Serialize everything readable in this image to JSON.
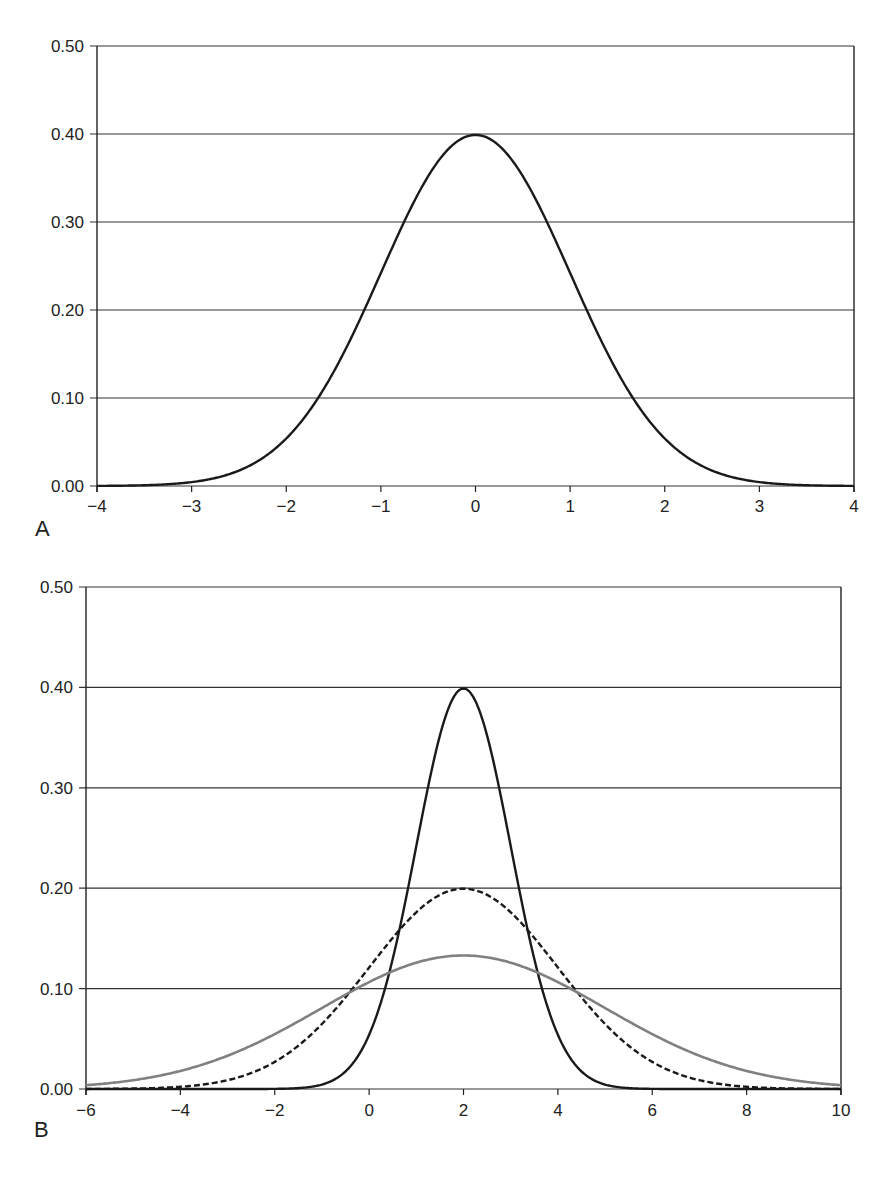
{
  "chart_data": [
    {
      "panel_label": "A",
      "type": "line",
      "title": "",
      "xlabel": "",
      "ylabel": "",
      "xlim": [
        -4,
        4
      ],
      "ylim": [
        0,
        0.5
      ],
      "x_ticks": [
        "−4",
        "−3",
        "−2",
        "−1",
        "0",
        "1",
        "2",
        "3",
        "4"
      ],
      "x_tick_values": [
        -4,
        -3,
        -2,
        -1,
        0,
        1,
        2,
        3,
        4
      ],
      "y_ticks": [
        "0.00",
        "0.10",
        "0.20",
        "0.30",
        "0.40",
        "0.50"
      ],
      "y_tick_values": [
        0,
        0.1,
        0.2,
        0.3,
        0.4,
        0.5
      ],
      "grid": "horizontal",
      "legend": "none",
      "series": [
        {
          "name": "Standard normal N(0,1)",
          "mean": 0,
          "sd": 1,
          "color": "#1a1a1a",
          "style": "solid",
          "x": [
            -4,
            -3.5,
            -3,
            -2.5,
            -2,
            -1.5,
            -1,
            -0.5,
            0,
            0.5,
            1,
            1.5,
            2,
            2.5,
            3,
            3.5,
            4
          ],
          "values": [
            0.0,
            0.001,
            0.004,
            0.018,
            0.054,
            0.13,
            0.242,
            0.352,
            0.399,
            0.352,
            0.242,
            0.13,
            0.054,
            0.018,
            0.004,
            0.001,
            0.0
          ]
        }
      ]
    },
    {
      "panel_label": "B",
      "type": "line",
      "title": "",
      "xlabel": "",
      "ylabel": "",
      "xlim": [
        -6,
        10
      ],
      "ylim": [
        0,
        0.5
      ],
      "x_ticks": [
        "−6",
        "−4",
        "−2",
        "0",
        "2",
        "4",
        "6",
        "8",
        "10"
      ],
      "x_tick_values": [
        -6,
        -4,
        -2,
        0,
        2,
        4,
        6,
        8,
        10
      ],
      "y_ticks": [
        "0.00",
        "0.10",
        "0.20",
        "0.30",
        "0.40",
        "0.50"
      ],
      "y_tick_values": [
        0,
        0.1,
        0.2,
        0.3,
        0.4,
        0.5
      ],
      "grid": "horizontal",
      "legend": "none",
      "series": [
        {
          "name": "Normal mean 2, SD 1",
          "mean": 2,
          "sd": 1,
          "color": "#1a1a1a",
          "style": "solid",
          "x": [
            -1,
            0,
            1,
            2,
            3,
            4,
            5
          ],
          "values": [
            0.004,
            0.054,
            0.242,
            0.399,
            0.242,
            0.054,
            0.004
          ]
        },
        {
          "name": "Normal mean 2, SD 2",
          "mean": 2,
          "sd": 2,
          "color": "#1a1a1a",
          "style": "dashed",
          "x": [
            -4,
            -2,
            0,
            2,
            4,
            6,
            8
          ],
          "values": [
            0.002,
            0.027,
            0.121,
            0.199,
            0.121,
            0.027,
            0.002
          ]
        },
        {
          "name": "Normal mean 2, SD 3",
          "mean": 2,
          "sd": 3,
          "color": "#808080",
          "style": "solid",
          "x": [
            -6,
            -4,
            -2,
            0,
            2,
            4,
            6,
            8,
            10
          ],
          "values": [
            0.004,
            0.018,
            0.055,
            0.106,
            0.133,
            0.106,
            0.055,
            0.018,
            0.004
          ]
        }
      ]
    }
  ],
  "panels": {
    "a": {
      "label": "A"
    },
    "b": {
      "label": "B"
    }
  }
}
